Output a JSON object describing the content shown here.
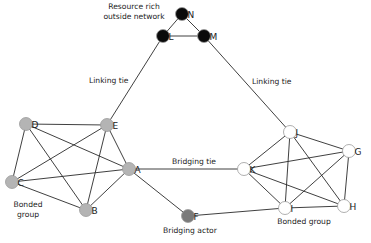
{
  "diagram": {
    "colors": {
      "outside": "#0a0a0a",
      "left_group": "#b4b4b4",
      "right_group": "#ffffff",
      "bridging_actor": "#7a7a7a",
      "edge": "#2a2a2a"
    },
    "nodes": [
      {
        "id": "N",
        "x": 182,
        "y": 14,
        "group": "outside"
      },
      {
        "id": "L",
        "x": 163,
        "y": 36,
        "group": "outside"
      },
      {
        "id": "M",
        "x": 204,
        "y": 36,
        "group": "outside"
      },
      {
        "id": "D",
        "x": 26,
        "y": 124,
        "group": "left_group"
      },
      {
        "id": "E",
        "x": 107,
        "y": 125,
        "group": "left_group"
      },
      {
        "id": "A",
        "x": 129,
        "y": 169,
        "group": "left_group"
      },
      {
        "id": "C",
        "x": 12,
        "y": 182,
        "group": "left_group"
      },
      {
        "id": "B",
        "x": 86,
        "y": 210,
        "group": "left_group"
      },
      {
        "id": "F",
        "x": 188,
        "y": 216,
        "group": "bridging_actor"
      },
      {
        "id": "J",
        "x": 290,
        "y": 132,
        "group": "right_group"
      },
      {
        "id": "G",
        "x": 349,
        "y": 151,
        "group": "right_group"
      },
      {
        "id": "K",
        "x": 244,
        "y": 169,
        "group": "right_group"
      },
      {
        "id": "I",
        "x": 285,
        "y": 208,
        "group": "right_group"
      },
      {
        "id": "H",
        "x": 344,
        "y": 206,
        "group": "right_group"
      }
    ],
    "edges": [
      [
        "N",
        "L"
      ],
      [
        "N",
        "M"
      ],
      [
        "L",
        "M"
      ],
      [
        "L",
        "E"
      ],
      [
        "M",
        "J"
      ],
      [
        "D",
        "E"
      ],
      [
        "D",
        "A"
      ],
      [
        "D",
        "C"
      ],
      [
        "D",
        "B"
      ],
      [
        "E",
        "A"
      ],
      [
        "E",
        "C"
      ],
      [
        "E",
        "B"
      ],
      [
        "A",
        "C"
      ],
      [
        "A",
        "B"
      ],
      [
        "C",
        "B"
      ],
      [
        "A",
        "K"
      ],
      [
        "A",
        "F"
      ],
      [
        "F",
        "I"
      ],
      [
        "J",
        "G"
      ],
      [
        "J",
        "K"
      ],
      [
        "J",
        "I"
      ],
      [
        "J",
        "H"
      ],
      [
        "G",
        "K"
      ],
      [
        "G",
        "I"
      ],
      [
        "G",
        "H"
      ],
      [
        "K",
        "I"
      ],
      [
        "K",
        "H"
      ],
      [
        "I",
        "H"
      ]
    ],
    "annotations": [
      {
        "id": "resource-rich",
        "lines": [
          "Resource rich",
          "outside network"
        ],
        "x": 134,
        "y": 9,
        "anchor": "middle"
      },
      {
        "id": "linking-tie-left",
        "lines": [
          "Linking tie"
        ],
        "x": 89,
        "y": 83,
        "anchor": "start"
      },
      {
        "id": "linking-tie-right",
        "lines": [
          "Linking tie"
        ],
        "x": 252,
        "y": 84,
        "anchor": "start"
      },
      {
        "id": "bridging-tie",
        "lines": [
          "Bridging tie"
        ],
        "x": 172,
        "y": 164,
        "anchor": "start"
      },
      {
        "id": "bonded-group-left",
        "lines": [
          "Bonded",
          "group"
        ],
        "x": 28,
        "y": 207,
        "anchor": "middle"
      },
      {
        "id": "bonded-group-right",
        "lines": [
          "Bonded group"
        ],
        "x": 304,
        "y": 224,
        "anchor": "middle"
      },
      {
        "id": "bridging-actor",
        "lines": [
          "Bridging actor"
        ],
        "x": 190,
        "y": 233,
        "anchor": "middle"
      }
    ]
  }
}
